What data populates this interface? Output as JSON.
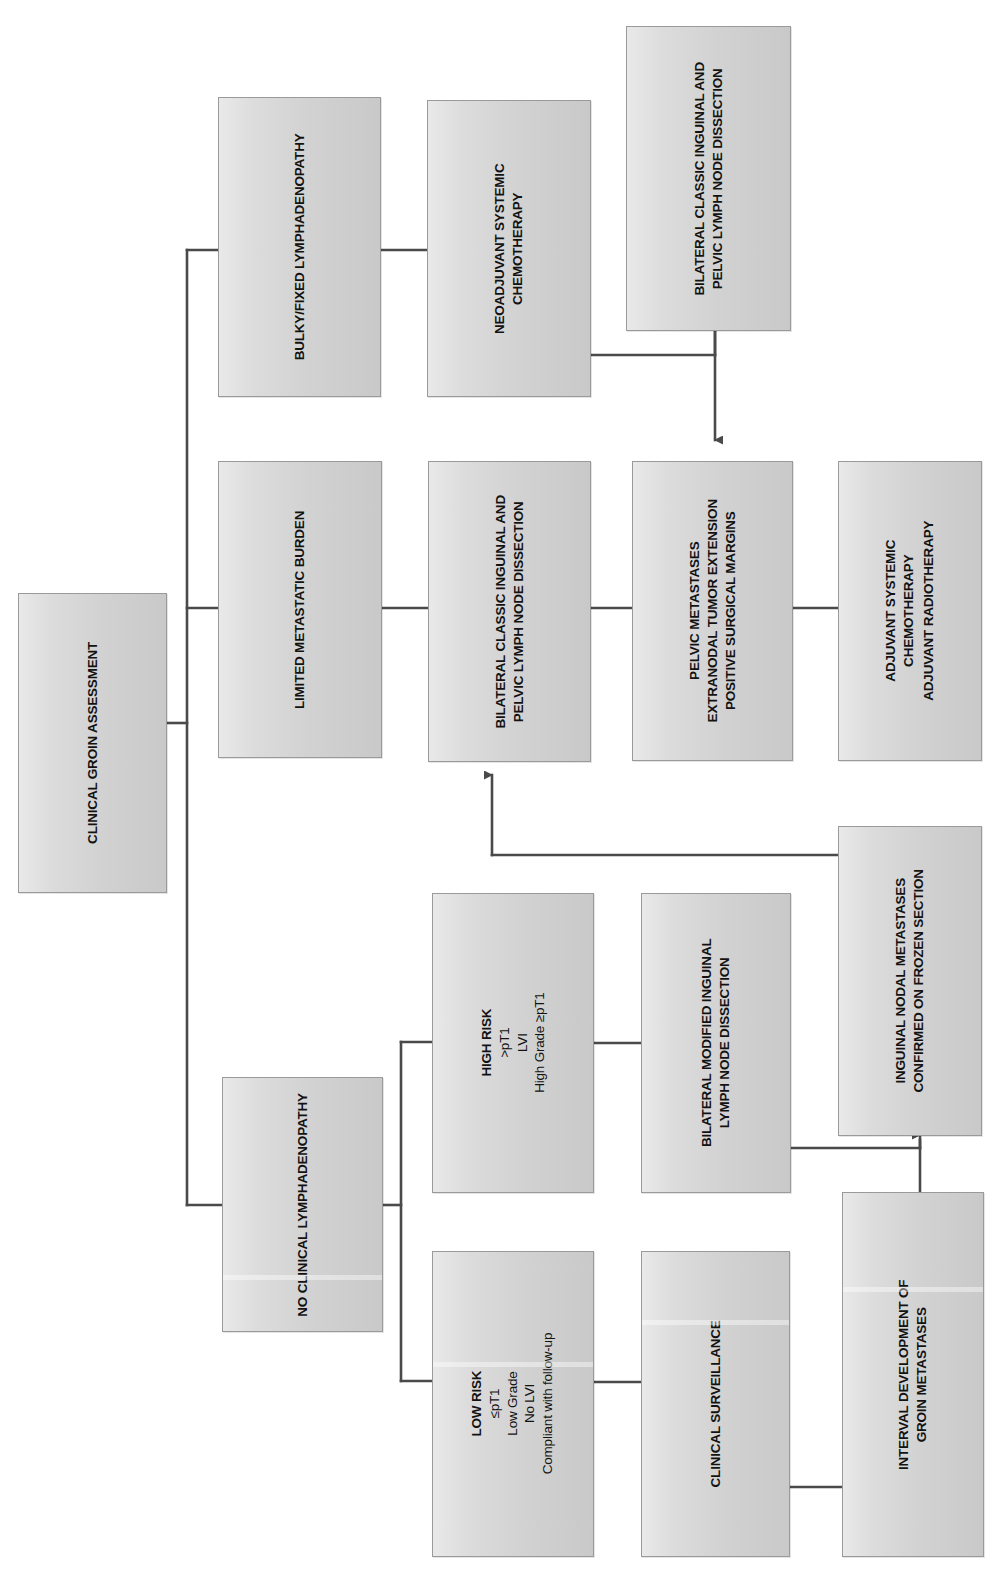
{
  "diagram": {
    "orientation": "rotated-90-ccw",
    "colors": {
      "box_fill_light": "#e9e9e9",
      "box_fill_dark": "#c9c9c9",
      "box_border": "#9a9a9a",
      "connector": "#4a4a4a",
      "text": "#121212",
      "background": "#ffffff"
    }
  },
  "nodes": {
    "root": {
      "name": "clinical-groin-assessment",
      "lines": [
        "CLINICAL GROIN ASSESSMENT"
      ]
    },
    "bulky": {
      "name": "bulky-fixed-lymphadenopathy",
      "lines": [
        "BULKY/FIXED LYMPHADENOPATHY"
      ]
    },
    "neoadjuvant": {
      "name": "neoadjuvant-systemic-chemotherapy",
      "lines": [
        "NEOADJUVANT SYSTEMIC",
        "CHEMOTHERAPY"
      ]
    },
    "classic_top": {
      "name": "bilateral-classic-inguinal-pelvic-dissection-top",
      "lines": [
        "BILATERAL CLASSIC INGUINAL AND",
        "PELVIC LYMPH NODE DISSECTION"
      ]
    },
    "limited": {
      "name": "limited-metastatic-burden",
      "lines": [
        "LIMITED METASTATIC BURDEN"
      ]
    },
    "classic_mid": {
      "name": "bilateral-classic-inguinal-pelvic-dissection-mid",
      "lines": [
        "BILATERAL CLASSIC INGUINAL AND",
        "PELVIC LYMPH  NODE DISSECTION"
      ]
    },
    "pelvic_mets": {
      "name": "pelvic-metastases-criteria",
      "lines": [
        "PELVIC METASTASES",
        "EXTRANODAL TUMOR EXTENSION",
        "POSITIVE SURGICAL MARGINS"
      ]
    },
    "adjuvant": {
      "name": "adjuvant-therapy",
      "lines": [
        "ADJUVANT SYSTEMIC",
        "CHEMOTHERAPY",
        "ADJUVANT RADIOTHERAPY"
      ]
    },
    "no_clinical": {
      "name": "no-clinical-lymphadenopathy",
      "lines": [
        "NO CLINICAL LYMPHADENOPATHY"
      ]
    },
    "high_risk": {
      "name": "high-risk-criteria",
      "heading": "HIGH RISK",
      "lines": [
        ">pT1",
        "LVI",
        "High Grade ≥pT1"
      ]
    },
    "low_risk": {
      "name": "low-risk-criteria",
      "heading": "LOW RISK",
      "lines": [
        "≤pT1",
        "Low Grade",
        "No LVI",
        "Compliant with follow-up"
      ]
    },
    "modified": {
      "name": "bilateral-modified-inguinal-dissection",
      "lines": [
        "BILATERAL MODIFIED  INGUINAL",
        "LYMPH NODE DISSECTION"
      ]
    },
    "surveillance": {
      "name": "clinical-surveillance",
      "lines": [
        "CLINICAL SURVEILLANCE"
      ]
    },
    "frozen": {
      "name": "inguinal-nodal-metastases-frozen-section",
      "lines": [
        "INGUINAL NODAL METASTASES",
        "CONFIRMED ON FROZEN SECTION"
      ]
    },
    "interval": {
      "name": "interval-development-groin-metastases",
      "lines": [
        "INTERVAL DEVELOPMENT OF",
        "GROIN METASTASES"
      ]
    }
  },
  "edges": [
    {
      "from": "root",
      "to": "bulky",
      "arrow": false
    },
    {
      "from": "root",
      "to": "limited",
      "arrow": false
    },
    {
      "from": "root",
      "to": "no_clinical",
      "arrow": false
    },
    {
      "from": "bulky",
      "to": "neoadjuvant",
      "arrow": false
    },
    {
      "from": "neoadjuvant",
      "to": "classic_top",
      "arrow": false
    },
    {
      "from": "classic_top",
      "to": "pelvic_mets",
      "arrow": true
    },
    {
      "from": "limited",
      "to": "classic_mid",
      "arrow": false
    },
    {
      "from": "classic_mid",
      "to": "pelvic_mets",
      "arrow": false
    },
    {
      "from": "pelvic_mets",
      "to": "adjuvant",
      "arrow": false
    },
    {
      "from": "no_clinical",
      "to": "high_risk",
      "arrow": false
    },
    {
      "from": "no_clinical",
      "to": "low_risk",
      "arrow": false
    },
    {
      "from": "high_risk",
      "to": "modified",
      "arrow": false
    },
    {
      "from": "low_risk",
      "to": "surveillance",
      "arrow": false
    },
    {
      "from": "modified",
      "to": "frozen",
      "arrow": true
    },
    {
      "from": "surveillance",
      "to": "interval",
      "arrow": false
    },
    {
      "from": "interval",
      "to": "frozen",
      "arrow": true
    },
    {
      "from": "frozen",
      "to": "classic_mid",
      "arrow": true
    }
  ]
}
